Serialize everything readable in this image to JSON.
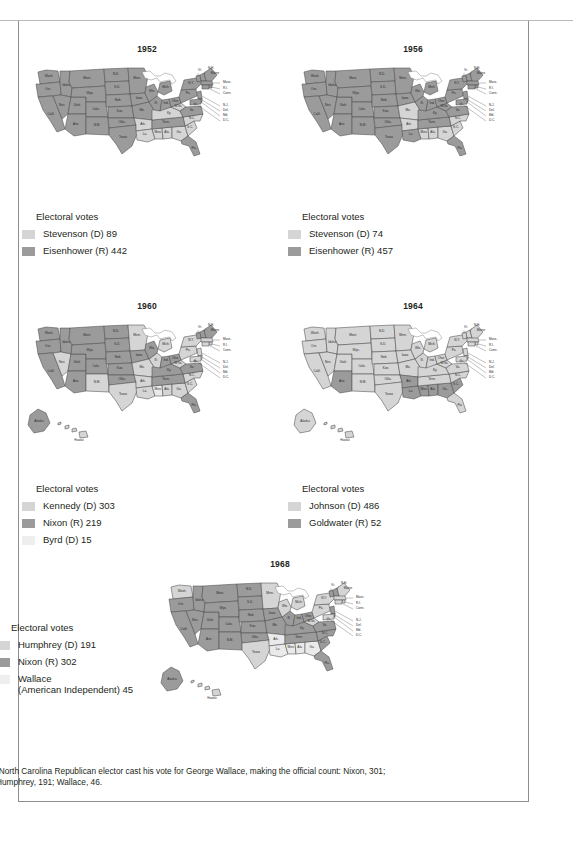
{
  "document": {
    "kind": "electoral-college-maps",
    "footnote_marker": "*",
    "footnote": "North Carolina Republican elector cast his vote for George Wallace, making the official count: Nixon, 301; Humphrey, 191; Wallace, 46."
  },
  "colors": {
    "democrat_light": "#d5d5d5",
    "republican_dark": "#9b9b9b",
    "third_party_lightest": "#eaeaea",
    "outline": "#4d4d4d",
    "text": "#231f20",
    "frame": "#8d8d8d",
    "water": "#ffffff"
  },
  "legend_heading": "Electoral votes",
  "maps": [
    {
      "id": "map-1952",
      "year": "1952",
      "legend": {
        "title": "Electoral votes",
        "entries": [
          {
            "label": "Stevenson (D) 89",
            "color_key": "democrat_light",
            "color": "#d5d5d5"
          },
          {
            "label": "Eisenhower (R) 442",
            "color_key": "republican_dark",
            "color": "#9b9b9b"
          }
        ]
      }
    },
    {
      "id": "map-1956",
      "year": "1956",
      "legend": {
        "title": "Electoral votes",
        "entries": [
          {
            "label": "Stevenson (D) 74",
            "color_key": "democrat_light",
            "color": "#d5d5d5"
          },
          {
            "label": "Eisenhower (R) 457",
            "color_key": "republican_dark",
            "color": "#9b9b9b"
          }
        ]
      }
    },
    {
      "id": "map-1960",
      "year": "1960",
      "legend": {
        "title": "Electoral votes",
        "entries": [
          {
            "label": "Kennedy (D) 303",
            "color_key": "democrat_light",
            "color": "#d5d5d5"
          },
          {
            "label": "Nixon (R) 219",
            "color_key": "republican_dark",
            "color": "#9b9b9b"
          },
          {
            "label": "Byrd (D) 15",
            "color_key": "third_party_lightest",
            "color": "#eeeeee"
          }
        ]
      }
    },
    {
      "id": "map-1964",
      "year": "1964",
      "legend": {
        "title": "Electoral votes",
        "entries": [
          {
            "label": "Johnson (D) 486",
            "color_key": "democrat_light",
            "color": "#d5d5d5"
          },
          {
            "label": "Goldwater (R) 52",
            "color_key": "republican_dark",
            "color": "#9b9b9b"
          }
        ]
      }
    },
    {
      "id": "map-1968",
      "year": "1968",
      "legend": {
        "title": "Electoral votes",
        "entries": [
          {
            "label": "Humphrey (D) 191",
            "color_key": "democrat_light",
            "color": "#d5d5d5"
          },
          {
            "label": "Nixon (R) 302",
            "color_key": "republican_dark",
            "color": "#9b9b9b"
          },
          {
            "label": "Wallace\n(American Independent) 45",
            "color_key": "third_party_lightest",
            "color": "#eeeeee"
          }
        ]
      }
    }
  ],
  "state_labels": [
    "Wash.",
    "Ore.",
    "Idaho",
    "Mont.",
    "Wyo.",
    "N.D.",
    "S.D.",
    "Neb.",
    "Kan.",
    "Minn.",
    "Iowa",
    "Mo.",
    "Nev.",
    "Utah",
    "Colo.",
    "Calif.",
    "Ariz.",
    "N.M.",
    "Okla.",
    "Texas",
    "Ark.",
    "La.",
    "Miss.",
    "Ala.",
    "Ga.",
    "Fla.",
    "S.C.",
    "N.C.",
    "Tenn.",
    "Ky.",
    "Va.",
    "W.Va",
    "Ohio",
    "Ind.",
    "Ill.",
    "Wis.",
    "Mich.",
    "Pa.",
    "N.Y.",
    "Vt.",
    "N.H.",
    "Maine",
    "Mass.",
    "R.I.",
    "Conn.",
    "N.J.",
    "Del.",
    "Md.",
    "D.C.",
    "Alaska",
    "Hawaii"
  ],
  "map_results": {
    "1952": {
      "dem": [
        "AL",
        "AR",
        "GA",
        "KY",
        "LA",
        "MS",
        "NC",
        "SC",
        "WV"
      ],
      "rep": [
        "AZ",
        "CA",
        "CO",
        "CT",
        "DE",
        "FL",
        "ID",
        "IL",
        "IN",
        "IA",
        "KS",
        "ME",
        "MD",
        "MA",
        "MI",
        "MN",
        "MO",
        "MT",
        "NE",
        "NV",
        "NH",
        "NJ",
        "NM",
        "NY",
        "ND",
        "OH",
        "OK",
        "OR",
        "PA",
        "RI",
        "SD",
        "TN",
        "TX",
        "UT",
        "VT",
        "VA",
        "WA",
        "WI",
        "WY"
      ],
      "other": []
    },
    "1956": {
      "dem": [
        "AL",
        "AR",
        "GA",
        "MS",
        "MO",
        "NC",
        "SC"
      ],
      "rep": [
        "AZ",
        "CA",
        "CO",
        "CT",
        "DE",
        "FL",
        "ID",
        "IL",
        "IN",
        "IA",
        "KS",
        "KY",
        "LA",
        "ME",
        "MD",
        "MA",
        "MI",
        "MN",
        "MT",
        "NE",
        "NV",
        "NH",
        "NJ",
        "NM",
        "NY",
        "ND",
        "OH",
        "OK",
        "OR",
        "PA",
        "RI",
        "SD",
        "TN",
        "TX",
        "UT",
        "VT",
        "VA",
        "WA",
        "WV",
        "WI",
        "WY"
      ],
      "other": []
    },
    "1960": {
      "dem": [
        "AL",
        "AR",
        "CT",
        "DE",
        "GA",
        "HI",
        "IL",
        "LA",
        "MD",
        "MA",
        "MI",
        "MN",
        "MO",
        "NV",
        "NJ",
        "NM",
        "NY",
        "NC",
        "PA",
        "RI",
        "SC",
        "TX",
        "WV"
      ],
      "rep": [
        "AK",
        "AZ",
        "CA",
        "CO",
        "FL",
        "ID",
        "IN",
        "IA",
        "KS",
        "ME",
        "MT",
        "NE",
        "NH",
        "ND",
        "OH",
        "OK",
        "OR",
        "SD",
        "TN",
        "UT",
        "VT",
        "VA",
        "WA",
        "WI",
        "WY",
        "KY"
      ],
      "other": [
        "MS"
      ]
    },
    "1964": {
      "dem": [
        "AK",
        "CA",
        "CO",
        "CT",
        "DE",
        "DC",
        "FL",
        "HI",
        "ID",
        "IL",
        "IN",
        "IA",
        "KS",
        "KY",
        "ME",
        "MD",
        "MA",
        "MI",
        "MN",
        "MO",
        "MT",
        "NE",
        "NV",
        "NH",
        "NJ",
        "NM",
        "NY",
        "NC",
        "ND",
        "OH",
        "OK",
        "OR",
        "PA",
        "RI",
        "SD",
        "TN",
        "TX",
        "UT",
        "VT",
        "VA",
        "WA",
        "WV",
        "WI",
        "WY"
      ],
      "rep": [
        "AZ",
        "AL",
        "GA",
        "LA",
        "MS",
        "SC"
      ],
      "other": []
    },
    "1968": {
      "dem": [
        "CT",
        "DC",
        "HI",
        "ME",
        "MD",
        "MA",
        "MI",
        "MN",
        "NY",
        "PA",
        "RI",
        "TX",
        "WA",
        "WV",
        "WI"
      ],
      "rep": [
        "AK",
        "AZ",
        "CA",
        "CO",
        "DE",
        "FL",
        "ID",
        "IL",
        "IN",
        "IA",
        "KS",
        "KY",
        "MO",
        "MT",
        "NE",
        "NV",
        "NH",
        "NJ",
        "NM",
        "NC",
        "ND",
        "OH",
        "OK",
        "OR",
        "SC",
        "SD",
        "TN",
        "UT",
        "VT",
        "VA",
        "WY"
      ],
      "other": [
        "AL",
        "AR",
        "GA",
        "LA",
        "MS"
      ]
    }
  }
}
